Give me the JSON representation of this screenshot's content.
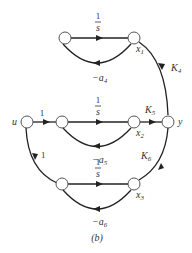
{
  "diagram": {
    "type": "signal-flow-graph",
    "caption": "(b)",
    "nodes": {
      "u": "u",
      "x1": "x",
      "x1_sub": "1",
      "x2": "x",
      "x2_sub": "2",
      "x3": "x",
      "x3_sub": "3",
      "y": "y"
    },
    "edges": {
      "top_forward_num": "1",
      "top_forward_den": "s",
      "top_feedback": "−a",
      "top_feedback_sub": "4",
      "mid_input_gain": "1",
      "mid_forward_num": "1",
      "mid_forward_den": "s",
      "mid_feedback": "−a",
      "mid_feedback_sub": "5",
      "bot_input_gain": "1",
      "bot_forward_num": "1",
      "bot_forward_den": "s",
      "bot_feedback": "−a",
      "bot_feedback_sub": "6",
      "k4": "K",
      "k4_sub": "4",
      "k5": "K",
      "k5_sub": "5",
      "k6": "K",
      "k6_sub": "6"
    }
  }
}
